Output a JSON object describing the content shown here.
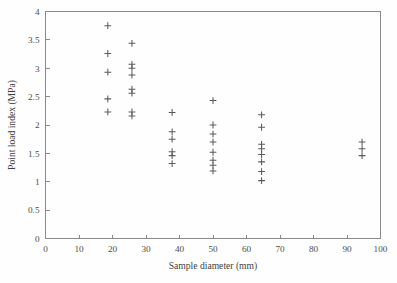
{
  "chart_data": {
    "type": "scatter",
    "title": "",
    "xlabel": "Sample diameter (mm)",
    "ylabel": "Point load index (MPa)",
    "xlim": [
      0,
      100
    ],
    "ylim": [
      0,
      4
    ],
    "xticks": [
      0,
      10,
      20,
      30,
      40,
      50,
      60,
      70,
      80,
      90,
      100
    ],
    "xtick_labels": [
      "0",
      "10",
      "20",
      "30",
      "40",
      "50",
      "60",
      "70",
      "80",
      "90",
      "100"
    ],
    "yticks": [
      0,
      0.5,
      1,
      1.5,
      2,
      2.5,
      3,
      3.5,
      4
    ],
    "ytick_labels": [
      "0",
      "0.5",
      "1",
      "1.5",
      "2",
      "2.5",
      "3",
      "3.5",
      "4"
    ],
    "grid": false,
    "legend": null,
    "marker": "plus",
    "marker_color": "#5a5a5a",
    "series": [
      {
        "name": "Point load index vs sample diameter",
        "points": [
          [
            18.6,
            3.75
          ],
          [
            18.6,
            3.26
          ],
          [
            18.6,
            2.93
          ],
          [
            18.6,
            2.46
          ],
          [
            18.6,
            2.23
          ],
          [
            25.8,
            3.44
          ],
          [
            25.8,
            3.07
          ],
          [
            25.8,
            3.0
          ],
          [
            25.8,
            2.88
          ],
          [
            25.8,
            2.63
          ],
          [
            25.8,
            2.56
          ],
          [
            25.8,
            2.23
          ],
          [
            25.8,
            2.16
          ],
          [
            37.8,
            2.22
          ],
          [
            37.8,
            1.88
          ],
          [
            37.8,
            1.75
          ],
          [
            37.8,
            1.53
          ],
          [
            37.8,
            1.46
          ],
          [
            37.8,
            1.32
          ],
          [
            50.0,
            2.43
          ],
          [
            50.0,
            2.0
          ],
          [
            50.0,
            1.84
          ],
          [
            50.0,
            1.7
          ],
          [
            50.0,
            1.52
          ],
          [
            50.0,
            1.38
          ],
          [
            50.0,
            1.29
          ],
          [
            50.0,
            1.19
          ],
          [
            64.5,
            2.18
          ],
          [
            64.5,
            1.96
          ],
          [
            64.5,
            1.66
          ],
          [
            64.5,
            1.58
          ],
          [
            64.5,
            1.48
          ],
          [
            64.5,
            1.35
          ],
          [
            64.5,
            1.18
          ],
          [
            64.5,
            1.02
          ],
          [
            94.5,
            1.7
          ],
          [
            94.5,
            1.58
          ],
          [
            94.5,
            1.46
          ]
        ]
      }
    ]
  },
  "figure": {
    "axis_color": "#8a8a8a",
    "background": "#fefefe"
  }
}
